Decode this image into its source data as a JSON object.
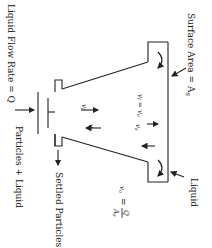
{
  "labels": {
    "liquid_flow_rate": "Liquid Flow Rate = Q",
    "surface_area": "Surface Area = A",
    "surface_area_sub": "s",
    "particles_liquid": "Particles + Liquid",
    "settled_particles": "Settled Particles",
    "liquid": "Liquid",
    "vl_eq_vo": "v",
    "vl_sub": "l",
    "eq": " = v",
    "vo_sub": "o",
    "vl": "v",
    "vl_sub2": "l",
    "vs": "v",
    "vs_sub": "s",
    "vs2": "v",
    "vs2_sub": "s",
    "vo_formula_lhs": "v",
    "vo_formula_sub": "o",
    "vo_formula_eq": "=",
    "vo_formula_num": "Q",
    "vo_formula_den": "A",
    "vo_formula_den_sub": "s"
  },
  "orientation": "rotated-90-clockwise"
}
